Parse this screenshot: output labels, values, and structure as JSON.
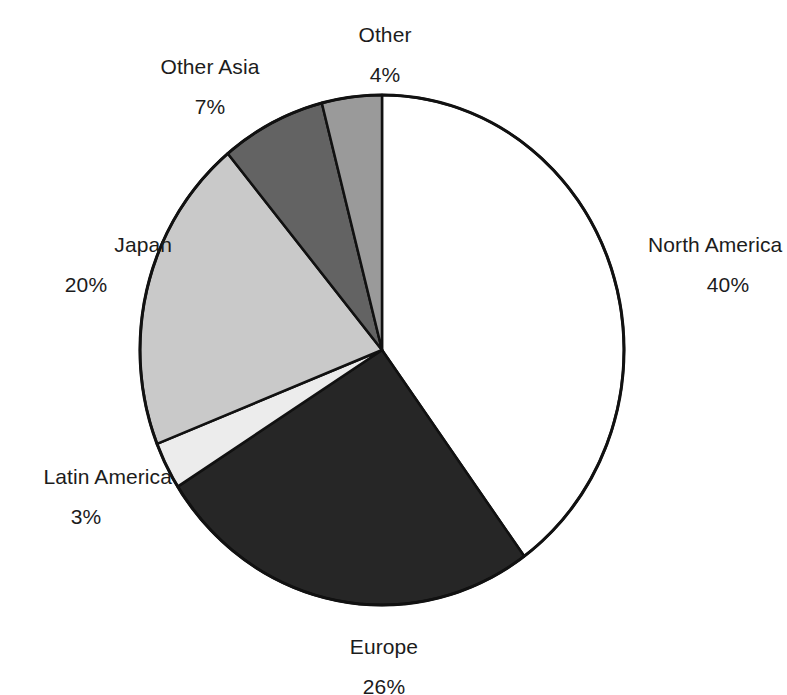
{
  "chart_data": {
    "type": "pie",
    "title": "",
    "subtitle": "",
    "xlabel": "",
    "ylabel": "",
    "legend_position": "none",
    "grid": false,
    "value_unit": "%",
    "start_angle_deg": 0,
    "direction": "clockwise",
    "categories": [
      "North America",
      "Europe",
      "Latin America",
      "Japan",
      "Other Asia",
      "Other"
    ],
    "values": [
      40,
      26,
      3,
      20,
      7,
      4
    ],
    "slices": [
      {
        "label": "North America",
        "value": 40,
        "value_text": "40%",
        "color": "#ffffff",
        "stroke": "#111111",
        "label_position": "right"
      },
      {
        "label": "Europe",
        "value": 26,
        "value_text": "26%",
        "color": "#262626",
        "stroke": "#111111",
        "label_position": "bottom"
      },
      {
        "label": "Latin America",
        "value": 3,
        "value_text": "3%",
        "color": "#ececec",
        "stroke": "#111111",
        "label_position": "left-bottom"
      },
      {
        "label": "Japan",
        "value": 20,
        "value_text": "20%",
        "color": "#c9c9c9",
        "stroke": "#111111",
        "label_position": "left"
      },
      {
        "label": "Other Asia",
        "value": 7,
        "value_text": "7%",
        "color": "#636363",
        "stroke": "#111111",
        "label_position": "top-left"
      },
      {
        "label": "Other",
        "value": 4,
        "value_text": "4%",
        "color": "#9a9a9a",
        "stroke": "#111111",
        "label_position": "top"
      }
    ]
  },
  "labels": {
    "north_america": {
      "name": "North America",
      "value": "40%"
    },
    "europe": {
      "name": "Europe",
      "value": "26%"
    },
    "latin_america": {
      "name": "Latin America",
      "value": "3%"
    },
    "japan": {
      "name": "Japan",
      "value": "20%"
    },
    "other_asia": {
      "name": "Other Asia",
      "value": "7%"
    },
    "other": {
      "name": "Other",
      "value": "4%"
    }
  },
  "colors": {
    "background": "#ffffff",
    "outline": "#111111",
    "text": "#1c1c1c",
    "north_america": "#ffffff",
    "europe": "#262626",
    "latin_america": "#ececec",
    "japan": "#c9c9c9",
    "other_asia": "#636363",
    "other": "#9a9a9a"
  }
}
